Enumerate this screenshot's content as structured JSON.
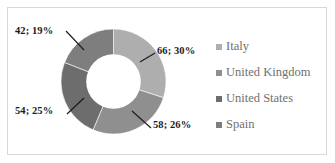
{
  "chart_data": {
    "type": "pie",
    "variant": "doughnut",
    "title": "",
    "subtitle": "",
    "xlabel": "",
    "ylabel": "",
    "grid": false,
    "legend_position": "right",
    "hole_ratio": 0.52,
    "start_angle_deg": 0,
    "direction": "clockwise",
    "total": 220,
    "categories": [
      "Italy",
      "United Kingdom",
      "United States",
      "Spain"
    ],
    "values": [
      66,
      58,
      54,
      42
    ],
    "percents": [
      30,
      26,
      25,
      19
    ],
    "data_labels": [
      "66; 30%",
      "58; 26%",
      "54; 25%",
      "42; 19%"
    ],
    "slice_colors": [
      "#aeaeae",
      "#8f8f8f",
      "#6d6d6d",
      "#7e7e7e"
    ],
    "slices": [
      {
        "name": "Italy",
        "value": 66,
        "percent": 30,
        "label": "66; 30%",
        "color": "#aeaeae"
      },
      {
        "name": "United Kingdom",
        "value": 58,
        "percent": 26,
        "label": "58; 26%",
        "color": "#8f8f8f"
      },
      {
        "name": "United States",
        "value": 54,
        "percent": 25,
        "label": "54; 25%",
        "color": "#6d6d6d"
      },
      {
        "name": "Spain",
        "value": 42,
        "percent": 19,
        "label": "42; 19%",
        "color": "#7e7e7e"
      }
    ]
  },
  "labels": {
    "italy": "66; 30%",
    "united_kingdom": "58; 26%",
    "united_states": "54; 25%",
    "spain": "42; 19%"
  },
  "legend": {
    "items": [
      {
        "label": "Italy",
        "color": "#aeaeae"
      },
      {
        "label": "United Kingdom",
        "color": "#8f8f8f"
      },
      {
        "label": "United States",
        "color": "#6d6d6d"
      },
      {
        "label": "Spain",
        "color": "#7e7e7e"
      }
    ]
  },
  "colors": {
    "frame": "#d8d8d8",
    "background": "#ffffff",
    "label_text": "#1b1b1b",
    "legend_text": "#6f6f6f",
    "leader_line": "#1b1b1b"
  }
}
